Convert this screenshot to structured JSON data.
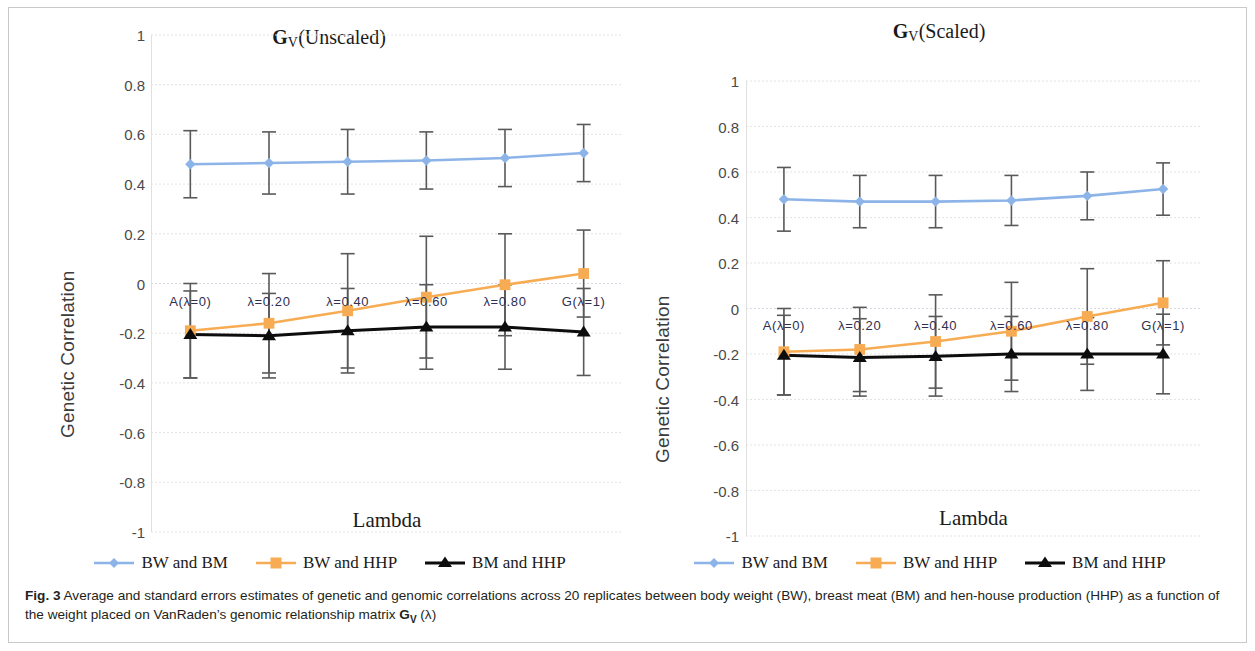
{
  "figure": {
    "label": "Fig. 3",
    "caption_line1": "Average and standard errors estimates of genetic and genomic correlations across 20 replicates between body weight (BW), breast meat",
    "caption_line2_a": "(BM) and hen-house production (HHP) as a function of the weight placed on VanRaden’s genomic relationship matrix ",
    "caption_gv": "G",
    "caption_gv_sub": "V",
    "caption_line2_b": " (λ)"
  },
  "colors": {
    "blue": "#8cb4e8",
    "orange": "#f7ac53",
    "black": "#0d0d0d",
    "errorbar": "#595959",
    "gridline": "#e3e3e3",
    "zeroline": "#d9d9e6",
    "axis_text": "#4a4a4a",
    "cat_text": "#2f2f4f"
  },
  "legend": {
    "items": [
      {
        "label": "BW and BM",
        "marker": "diamond-marker",
        "color": "#8cb4e8"
      },
      {
        "label": "BW and HHP",
        "marker": "square-marker",
        "color": "#f7ac53"
      },
      {
        "label": "BM and HHP",
        "marker": "triangle-marker",
        "color": "#0d0d0d"
      }
    ]
  },
  "chart_data": [
    {
      "type": "line",
      "title": "G_V(Unscaled)",
      "title_parts": {
        "g": "G",
        "sub": "V",
        "rest": "(Unscaled)"
      },
      "xlabel": "Lambda",
      "ylabel": "Genetic Correlation",
      "ylim": [
        -1,
        1
      ],
      "yticks": [
        1,
        0.8,
        0.6,
        0.4,
        0.2,
        0,
        -0.2,
        -0.4,
        -0.6,
        -0.8,
        -1
      ],
      "ytick_labels": [
        "1",
        "0.8",
        "0.6",
        "0.4",
        "0.2",
        "0",
        "-0.2",
        "-0.4",
        "-0.6",
        "-0.8",
        "-1"
      ],
      "grid": true,
      "legend_position": "bottom",
      "categories": [
        "A(λ=0)",
        "λ=0.20",
        "λ=0.40",
        "λ=0.60",
        "λ=0.80",
        "G(λ=1)"
      ],
      "series": [
        {
          "name": "BW and BM",
          "color": "#8cb4e8",
          "marker": "diamond",
          "values": [
            0.48,
            0.485,
            0.49,
            0.495,
            0.505,
            0.525
          ],
          "errors": [
            0.135,
            0.125,
            0.13,
            0.115,
            0.115,
            0.115
          ]
        },
        {
          "name": "BW and HHP",
          "color": "#f7ac53",
          "marker": "square",
          "values": [
            -0.19,
            -0.16,
            -0.11,
            -0.055,
            -0.005,
            0.04
          ],
          "errors": [
            0.19,
            0.2,
            0.23,
            0.245,
            0.205,
            0.175
          ]
        },
        {
          "name": "BM and HHP",
          "color": "#0d0d0d",
          "marker": "triangle",
          "values": [
            -0.205,
            -0.21,
            -0.19,
            -0.175,
            -0.175,
            -0.195
          ],
          "errors": [
            0.175,
            0.17,
            0.17,
            0.17,
            0.17,
            0.175
          ]
        }
      ]
    },
    {
      "type": "line",
      "title": "G_V(Scaled)",
      "title_parts": {
        "g": "G",
        "sub": "V",
        "rest": "(Scaled)"
      },
      "xlabel": "Lambda",
      "ylabel": "Genetic  Correlation",
      "ylim": [
        -1,
        1
      ],
      "yticks": [
        1,
        0.8,
        0.6,
        0.4,
        0.2,
        0,
        -0.2,
        -0.4,
        -0.6,
        -0.8,
        -1
      ],
      "ytick_labels": [
        "1",
        "0.8",
        "0.6",
        "0.4",
        "0.2",
        "0",
        "-0.2",
        "-0.4",
        "-0.6",
        "-0.8",
        "-1"
      ],
      "grid": true,
      "legend_position": "bottom",
      "categories": [
        "A(λ=0)",
        "λ=0.20",
        "λ=0.40",
        "λ=0.60",
        "λ=0.80",
        "G(λ=1)"
      ],
      "series": [
        {
          "name": "BW and BM",
          "color": "#8cb4e8",
          "marker": "diamond",
          "values": [
            0.48,
            0.47,
            0.47,
            0.475,
            0.495,
            0.525
          ],
          "errors": [
            0.14,
            0.115,
            0.115,
            0.11,
            0.105,
            0.115
          ]
        },
        {
          "name": "BW and HHP",
          "color": "#f7ac53",
          "marker": "square",
          "values": [
            -0.19,
            -0.18,
            -0.145,
            -0.1,
            -0.035,
            0.025
          ],
          "errors": [
            0.19,
            0.185,
            0.205,
            0.215,
            0.21,
            0.185
          ]
        },
        {
          "name": "BM and HHP",
          "color": "#0d0d0d",
          "marker": "triangle",
          "values": [
            -0.205,
            -0.215,
            -0.21,
            -0.2,
            -0.2,
            -0.2
          ],
          "errors": [
            0.175,
            0.17,
            0.175,
            0.165,
            0.16,
            0.175
          ]
        }
      ]
    }
  ]
}
